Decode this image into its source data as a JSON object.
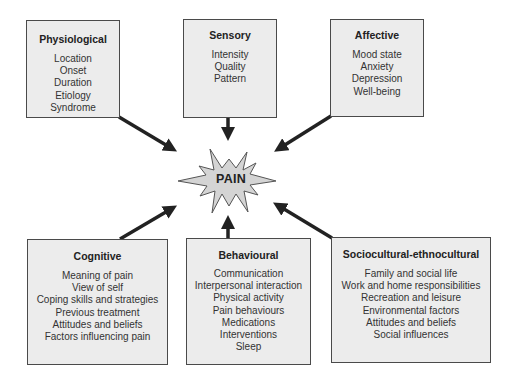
{
  "center": {
    "label": "PAIN",
    "fill": "#d4d4d4",
    "stroke": "#555555"
  },
  "boxes": {
    "physiological": {
      "title": "Physiological",
      "items": [
        "Location",
        "Onset",
        "Duration",
        "Etiology",
        "Syndrome"
      ]
    },
    "sensory": {
      "title": "Sensory",
      "items": [
        "Intensity",
        "Quality",
        "Pattern"
      ]
    },
    "affective": {
      "title": "Affective",
      "items": [
        "Mood state",
        "Anxiety",
        "Depression",
        "Well-being"
      ]
    },
    "cognitive": {
      "title": "Cognitive",
      "items": [
        "Meaning of pain",
        "View of self",
        "Coping skills and strategies",
        "Previous treatment",
        "Attitudes and beliefs",
        "Factors influencing pain"
      ]
    },
    "behavioural": {
      "title": "Behavioural",
      "items": [
        "Communication",
        "Interpersonal interaction",
        "Physical activity",
        "Pain behaviours",
        "Medications",
        "Interventions",
        "Sleep"
      ]
    },
    "sociocultural": {
      "title": "Sociocultural-ethnocultural",
      "items": [
        "Family and social life",
        "Work and home responsibilities",
        "Recreation and leisure",
        "Environmental factors",
        "Attitudes and beliefs",
        "Social influences"
      ]
    }
  },
  "colors": {
    "box_fill": "#ececec",
    "box_border": "#4a4a4a",
    "arrow": "#222222"
  }
}
